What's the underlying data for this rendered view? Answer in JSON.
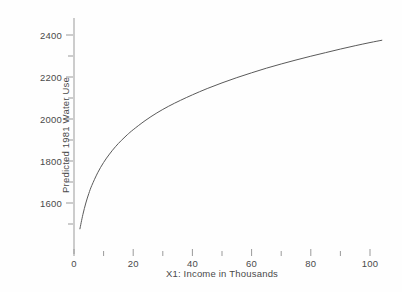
{
  "chart_data": {
    "type": "line",
    "title": "",
    "subtitle": "",
    "xlabel": "X1: Income in Thousands",
    "ylabel": "Predicted 1981 Water Use",
    "xlim": [
      0,
      106
    ],
    "ylim": [
      1440,
      2500
    ],
    "grid": false,
    "legend": null,
    "x_major_ticks": [
      0,
      20,
      40,
      60,
      80,
      100
    ],
    "x_major_tick_labels": [
      "0",
      "20",
      "40",
      "60",
      "80",
      "100"
    ],
    "x_minor_ticks": [
      10,
      30,
      50,
      70,
      90
    ],
    "y_major_ticks": [
      1600,
      1800,
      2000,
      2200,
      2400
    ],
    "y_major_tick_labels": [
      "1600",
      "1800",
      "2000",
      "2200",
      "2400"
    ],
    "y_minor_ticks": [
      1500,
      1700,
      1900,
      2100,
      2300
    ],
    "series": [
      {
        "name": "Predicted 1981 Water Use",
        "color": "#5a5a5a",
        "x": [
          2,
          3,
          4,
          5,
          6,
          8,
          10,
          12,
          14,
          16,
          18,
          20,
          24,
          28,
          32,
          36,
          40,
          45,
          50,
          55,
          60,
          65,
          70,
          75,
          80,
          85,
          90,
          95,
          100,
          104
        ],
        "y": [
          1477,
          1545,
          1600,
          1645,
          1683,
          1744,
          1793,
          1833,
          1868,
          1898,
          1925,
          1949,
          1992,
          2029,
          2061,
          2089,
          2115,
          2145,
          2172,
          2197,
          2220,
          2242,
          2262,
          2281,
          2299,
          2316,
          2333,
          2349,
          2364,
          2375
        ]
      }
    ]
  },
  "axis": {
    "x_label": "X1: Income in Thousands",
    "y_label": "Predicted 1981 Water Use"
  }
}
